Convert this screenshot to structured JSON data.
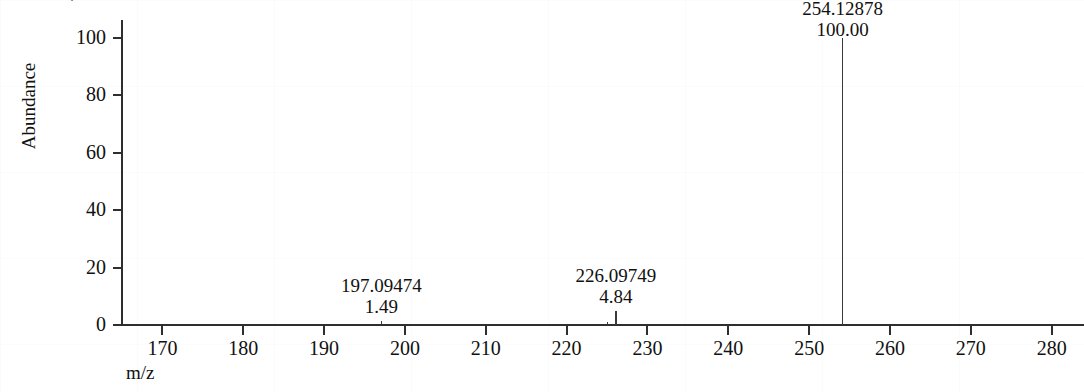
{
  "clipped_title": "Mass Spectrum",
  "chart_data": {
    "type": "bar",
    "title": "",
    "xlabel": "m/z",
    "ylabel": "Abundance",
    "xlim": [
      165,
      284
    ],
    "ylim": [
      0,
      108
    ],
    "grid": false,
    "legend": null,
    "x_ticks": [
      170,
      180,
      190,
      200,
      210,
      220,
      230,
      240,
      250,
      260,
      270,
      280
    ],
    "x_tick_labels": [
      "170",
      "180",
      "190",
      "200",
      "210",
      "220",
      "230",
      "240",
      "250",
      "260",
      "270",
      "280"
    ],
    "y_ticks": [
      0,
      20,
      40,
      60,
      80,
      100
    ],
    "y_tick_labels": [
      "0",
      "20",
      "40",
      "60",
      "80",
      "100"
    ],
    "x": [
      197.09474,
      225.1,
      226.09749,
      254.12878
    ],
    "values": [
      1.49,
      1.2,
      4.84,
      100.0
    ],
    "annotations": [
      {
        "mz": "197.09474",
        "rel": "1.49",
        "x": 197.09474,
        "y": 1.49
      },
      {
        "mz": "226.09749",
        "rel": "4.84",
        "x": 226.09749,
        "y": 4.84
      },
      {
        "mz": "254.12878",
        "rel": "100.00",
        "x": 254.12878,
        "y": 100.0
      }
    ]
  },
  "axes": {
    "y_title": "Abundance",
    "x_title": "m/z",
    "y_ticks": [
      {
        "label": "100",
        "value": 100
      },
      {
        "label": "80",
        "value": 80
      },
      {
        "label": "60",
        "value": 60
      },
      {
        "label": "40",
        "value": 40
      },
      {
        "label": "20",
        "value": 20
      },
      {
        "label": "0",
        "value": 0
      }
    ],
    "x_ticks": [
      {
        "label": "170",
        "value": 170
      },
      {
        "label": "180",
        "value": 180
      },
      {
        "label": "190",
        "value": 190
      },
      {
        "label": "200",
        "value": 200
      },
      {
        "label": "210",
        "value": 210
      },
      {
        "label": "220",
        "value": 220
      },
      {
        "label": "230",
        "value": 230
      },
      {
        "label": "240",
        "value": 240
      },
      {
        "label": "250",
        "value": 250
      },
      {
        "label": "260",
        "value": 260
      },
      {
        "label": "270",
        "value": 270
      },
      {
        "label": "280",
        "value": 280
      }
    ]
  },
  "peak_labels": [
    {
      "mz": "197.09474",
      "rel": "1.49"
    },
    {
      "mz": "226.09749",
      "rel": "4.84"
    },
    {
      "mz": "254.12878",
      "rel": "100.00"
    }
  ],
  "colors": {
    "axis": "#2e2e2e",
    "peak": "#3a3a3a",
    "text": "#111111",
    "background": "#ffffff"
  }
}
